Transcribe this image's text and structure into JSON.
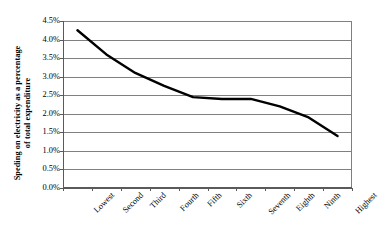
{
  "chart_data": {
    "type": "line",
    "title": "",
    "xlabel": "",
    "ylabel": "Speding on electricity as a percentage of total expenditure",
    "ylabel_lines": [
      "Speding on electricity as a percentage",
      "of total expenditure"
    ],
    "categories": [
      "Lowest",
      "Second",
      "Third",
      "Fourth",
      "Fifth",
      "Sixth",
      "Seventh",
      "Eighth",
      "Ninth",
      "Highest"
    ],
    "values": [
      4.25,
      3.6,
      3.1,
      2.75,
      2.45,
      2.4,
      2.4,
      2.2,
      1.9,
      1.4
    ],
    "value_labels": [
      "4.25%",
      "3.6%",
      "3.1%",
      "2.75%",
      "2.45%",
      "2.4%",
      "2.4%",
      "2.2%",
      "1.9%",
      "1.4%"
    ],
    "ylim": [
      0.0,
      4.5
    ],
    "ytick_values": [
      0.0,
      0.5,
      1.0,
      1.5,
      2.0,
      2.5,
      3.0,
      3.5,
      4.0,
      4.5
    ],
    "ytick_labels": [
      "0.0%",
      "0.5%",
      "1.0%",
      "1.5%",
      "2.0%",
      "2.5%",
      "3.0%",
      "3.5%",
      "4.0%",
      "4.5%"
    ],
    "grid": true,
    "grid_axis": "y",
    "legend": false,
    "legend_position": "none",
    "series": [
      {
        "name": "Spending on electricity",
        "values": [
          4.25,
          3.6,
          3.1,
          2.75,
          2.45,
          2.4,
          2.4,
          2.2,
          1.9,
          1.4
        ],
        "color": "#000000",
        "line_width": 2.4,
        "marker": "none"
      }
    ],
    "colors": {
      "line": "#000000",
      "grid": "#808080",
      "axis": "#5a5a5a",
      "background": "#ffffff",
      "text": "#000000"
    }
  }
}
